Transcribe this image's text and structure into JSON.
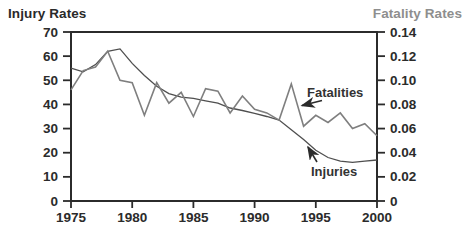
{
  "chart_data": {
    "type": "line",
    "title": "",
    "x_label": "",
    "x": [
      1975,
      1976,
      1977,
      1978,
      1979,
      1980,
      1981,
      1982,
      1983,
      1984,
      1985,
      1986,
      1987,
      1988,
      1989,
      1990,
      1991,
      1992,
      1993,
      1994,
      1995,
      1996,
      1997,
      1998,
      1999,
      2000
    ],
    "x_ticks": [
      "1975",
      "1980",
      "1985",
      "1990",
      "1995",
      "2000"
    ],
    "x_range": [
      1975,
      2000
    ],
    "left_axis": {
      "title": "Injury Rates",
      "range": [
        0,
        70
      ],
      "ticks": [
        "0",
        "10",
        "20",
        "30",
        "40",
        "50",
        "60",
        "70"
      ]
    },
    "right_axis": {
      "title": "Fatality Rates",
      "range": [
        0,
        0.14
      ],
      "ticks": [
        "0",
        "0.02",
        "0.04",
        "0.06",
        "0.08",
        "0.10",
        "0.12",
        "0.14"
      ]
    },
    "grid": false,
    "legend": "annotations-with-arrows",
    "series": [
      {
        "name": "Injuries",
        "axis": "left",
        "color": "#4f4f4f",
        "values": [
          55,
          53.5,
          56.5,
          62,
          63,
          57,
          52,
          47.5,
          44.5,
          43,
          42.5,
          41.5,
          40.5,
          38.5,
          37.5,
          36.3,
          35,
          33.5,
          29.5,
          25.5,
          21,
          18,
          16.5,
          16,
          16.5,
          17
        ]
      },
      {
        "name": "Fatalities",
        "axis": "right",
        "color": "#7f7f7f",
        "values": [
          0.092,
          0.108,
          0.111,
          0.124,
          0.1,
          0.098,
          0.071,
          0.098,
          0.081,
          0.09,
          0.07,
          0.093,
          0.091,
          0.073,
          0.087,
          0.076,
          0.073,
          0.067,
          0.097,
          0.062,
          0.071,
          0.065,
          0.073,
          0.06,
          0.064,
          0.054
        ]
      }
    ],
    "annotations": [
      {
        "text": "Fatalities",
        "series": "Fatalities"
      },
      {
        "text": "Injuries",
        "series": "Injuries"
      }
    ]
  },
  "colors": {
    "axis": "#2b2b2b",
    "background": "#ffffff",
    "left_title": "#2a2a2a",
    "right_title": "#8e8e8e"
  }
}
